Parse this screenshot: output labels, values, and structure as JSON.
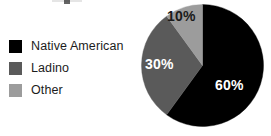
{
  "figure": {
    "background": "#ffffff",
    "title_remnant": "",
    "width": 271,
    "height": 136
  },
  "legend": {
    "position": "left",
    "items": [
      {
        "label": "Native American",
        "color": "#000000",
        "swatch_name": "legend-swatch-native-american"
      },
      {
        "label": "Ladino",
        "color": "#5a5a5a",
        "swatch_name": "legend-swatch-ladino"
      },
      {
        "label": "Other",
        "color": "#9c9c9c",
        "swatch_name": "legend-swatch-other"
      }
    ]
  },
  "pie": {
    "labels": {
      "native_american": "60%",
      "ladino": "30%",
      "other": "10%"
    }
  },
  "chart_data": {
    "type": "pie",
    "title": "",
    "xlabel": "",
    "ylabel": "",
    "categories": [
      "Native American",
      "Ladino",
      "Other"
    ],
    "values": [
      60,
      30,
      10
    ],
    "value_labels": [
      "60%",
      "30%",
      "10%"
    ],
    "colors": [
      "#000000",
      "#5a5a5a",
      "#9c9c9c"
    ],
    "label_text_colors": [
      "#ffffff",
      "#ffffff",
      "#1a1a1a"
    ],
    "units": "percent",
    "total": 100,
    "start_angle_deg": 0,
    "direction": "clockwise",
    "grid": false,
    "legend": true,
    "legend_position": "left",
    "slice_angles_deg": [
      {
        "name": "Native American",
        "start": 0,
        "end": 216
      },
      {
        "name": "Ladino",
        "start": 216,
        "end": 324
      },
      {
        "name": "Other",
        "start": 324,
        "end": 360
      }
    ]
  }
}
